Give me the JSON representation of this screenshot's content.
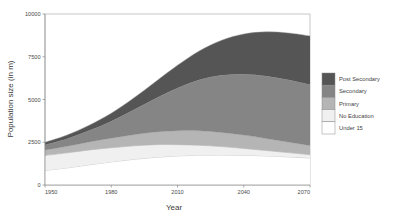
{
  "chart_data": {
    "type": "area",
    "stacked": true,
    "title": "",
    "xlabel": "Year",
    "ylabel": "Population size (in m)",
    "xlim": [
      1950,
      2070
    ],
    "ylim": [
      0,
      10000
    ],
    "xticks": [
      1950,
      1980,
      2010,
      2040,
      2070
    ],
    "yticks": [
      0,
      2500,
      5000,
      7500,
      10000
    ],
    "xtick_labels": [
      "1950",
      "1980",
      "2010",
      "2040",
      "2070"
    ],
    "ytick_labels": [
      "0",
      "2500",
      "5000",
      "7500",
      "10000"
    ],
    "grid": false,
    "legend_position": "right",
    "x": [
      1950,
      1960,
      1970,
      1980,
      1990,
      2000,
      2010,
      2020,
      2030,
      2040,
      2050,
      2060,
      2070
    ],
    "series": [
      {
        "name": "Under 15",
        "color": "#ffffff",
        "values": [
          850,
          1000,
          1180,
          1350,
          1500,
          1620,
          1700,
          1745,
          1755,
          1740,
          1700,
          1645,
          1580
        ]
      },
      {
        "name": "No Education",
        "color": "#f0f0f0",
        "values": [
          880,
          880,
          870,
          830,
          790,
          740,
          660,
          580,
          490,
          400,
          320,
          250,
          195
        ]
      },
      {
        "name": "Primary",
        "color": "#b5b5b5",
        "values": [
          310,
          380,
          470,
          560,
          650,
          740,
          810,
          845,
          830,
          780,
          705,
          620,
          530
        ]
      },
      {
        "name": "Secondary",
        "color": "#858585",
        "values": [
          300,
          440,
          660,
          990,
          1440,
          1960,
          2500,
          2980,
          3340,
          3560,
          3650,
          3640,
          3570
        ]
      },
      {
        "name": "Post Secondary",
        "color": "#555555",
        "values": [
          160,
          220,
          320,
          470,
          690,
          980,
          1330,
          1700,
          2050,
          2350,
          2580,
          2740,
          2845
        ]
      }
    ],
    "stack_totals": [
      2500,
      2920,
      3500,
      4200,
      5070,
      6040,
      7000,
      7850,
      8465,
      8830,
      8955,
      8895,
      8720
    ]
  },
  "legend": {
    "items": [
      {
        "label": "Post Secondary",
        "color": "#555555"
      },
      {
        "label": "Secondary",
        "color": "#858585"
      },
      {
        "label": "Primary",
        "color": "#b5b5b5"
      },
      {
        "label": "No Education",
        "color": "#f0f0f0"
      },
      {
        "label": "Under 15",
        "color": "#ffffff"
      }
    ]
  }
}
